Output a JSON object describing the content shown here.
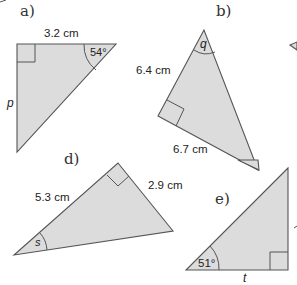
{
  "figure": {
    "fill_color": "#dcdcdc",
    "stroke_color": "#555555",
    "triangles": [
      {
        "label": "a)",
        "side_label_top": "3.2 cm",
        "angle_label": "54°",
        "unknown": "p"
      },
      {
        "label": "b)",
        "side_label_left": "6.4 cm",
        "side_label_bottom": "6.7 cm",
        "unknown": "q"
      },
      {
        "label": "d)",
        "side_label_left": "5.3 cm",
        "side_label_right": "2.9 cm",
        "unknown": "s"
      },
      {
        "label": "e)",
        "angle_label": "51°",
        "unknown": "t"
      }
    ]
  }
}
